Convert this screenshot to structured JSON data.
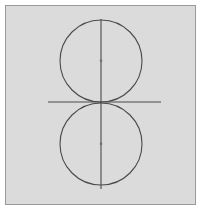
{
  "figure": {
    "background_color": "#ffffff",
    "canvas_color": "#dcdcdc",
    "frame": {
      "name": "outer-frame",
      "stroke_color": "#9a9a9a",
      "stroke_width": 1,
      "x": 5,
      "y": 5,
      "width": 191,
      "height": 200
    },
    "stroke_color": "#4a4a4a",
    "stroke_width": 1.1,
    "center_marker_glyph": "×",
    "shapes": [
      {
        "id": "upper-circle",
        "type": "circle",
        "cx": 101,
        "cy": 61,
        "r": 41,
        "label": "Upper circle"
      },
      {
        "id": "lower-circle",
        "type": "circle",
        "cx": 101,
        "cy": 144,
        "r": 41,
        "label": "Lower circle"
      },
      {
        "id": "horizontal-tangent-line",
        "type": "line",
        "x1": 48,
        "y1": 102,
        "x2": 161,
        "y2": 102,
        "label": "Horizontal tangent line"
      },
      {
        "id": "vertical-center-line",
        "type": "line",
        "x1": 101,
        "y1": 19,
        "x2": 101,
        "y2": 189,
        "label": "Vertical line through centers"
      }
    ],
    "center_markers": [
      {
        "id": "upper-center-marker",
        "glyph": "×",
        "x": 101,
        "y": 61,
        "label": "Center of upper circle"
      },
      {
        "id": "lower-center-marker",
        "glyph": "×",
        "x": 101,
        "y": 144,
        "label": "Center of lower circle"
      }
    ],
    "tangent_point": {
      "id": "tangency-point",
      "x": 101,
      "y": 102,
      "label": "Point of tangency"
    }
  }
}
